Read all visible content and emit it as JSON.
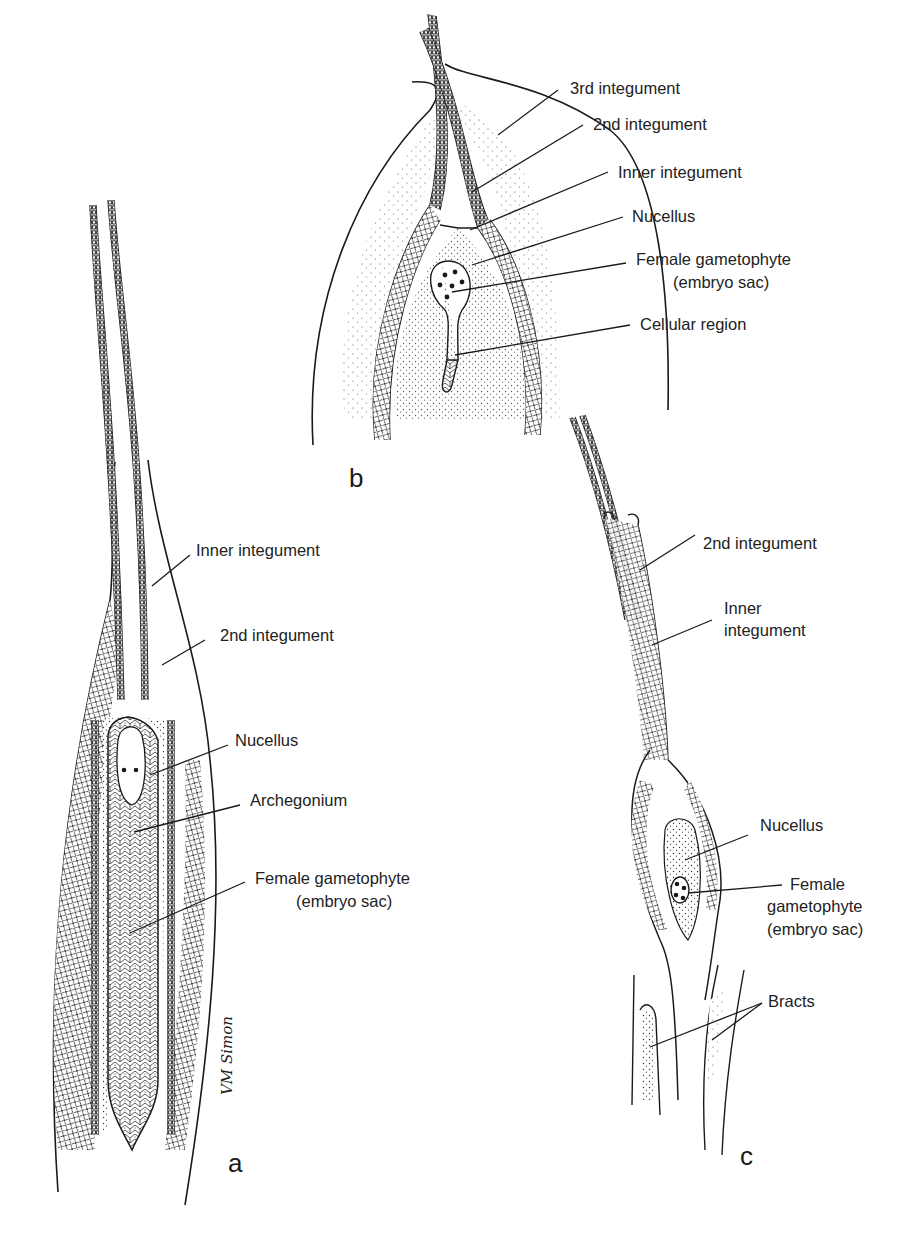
{
  "figure": {
    "ink_color": "#1a1a1a",
    "background": "#ffffff",
    "signature": "VM Simon"
  },
  "panels": {
    "a": {
      "letter": "a",
      "labels": {
        "inner_integument": "Inner integument",
        "second_integument": "2nd integument",
        "nucellus": "Nucellus",
        "archegonium": "Archegonium",
        "female_gametophyte": "Female gametophyte",
        "embryo_sac": "(embryo sac)"
      }
    },
    "b": {
      "letter": "b",
      "labels": {
        "third_integument": "3rd integument",
        "second_integument": "2nd integument",
        "inner_integument": "Inner integument",
        "nucellus": "Nucellus",
        "female_gametophyte": "Female gametophyte",
        "embryo_sac": "(embryo sac)",
        "cellular_region": "Cellular region"
      }
    },
    "c": {
      "letter": "c",
      "labels": {
        "second_integument": "2nd integument",
        "inner_line1": "Inner",
        "inner_line2": "integument",
        "nucellus": "Nucellus",
        "female_line1": "Female",
        "female_line2": "gametophyte",
        "embryo_sac": "(embryo sac)",
        "bracts": "Bracts"
      }
    }
  }
}
